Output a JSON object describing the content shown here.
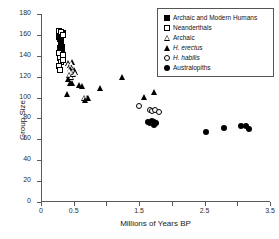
{
  "chart_data": {
    "type": "scatter",
    "title": "",
    "xlabel": "Millions of Years BP",
    "ylabel": "Group Size",
    "xlim": [
      0,
      3.5
    ],
    "ylim": [
      0,
      180
    ],
    "grid": false,
    "legend_position": "upper right",
    "xticks": [
      0,
      0.5,
      1.0,
      1.5,
      2.0,
      2.5,
      3.0,
      3.5
    ],
    "xtick_labels": [
      "0",
      "0.5",
      "",
      "1.5",
      "",
      "2.5",
      "",
      "3.5"
    ],
    "yticks": [
      0,
      20,
      40,
      60,
      80,
      100,
      120,
      140,
      160,
      180
    ],
    "ytick_labels": [
      "0",
      "20",
      "40",
      "60",
      "80",
      "100",
      "120",
      "140",
      "160",
      "180"
    ],
    "series": [
      {
        "name": "Archaic and Modern Humans",
        "marker": "filled-square",
        "points": [
          [
            0.28,
            158
          ],
          [
            0.29,
            156
          ],
          [
            0.3,
            154
          ],
          [
            0.31,
            152
          ],
          [
            0.3,
            150
          ],
          [
            0.32,
            148
          ],
          [
            0.31,
            160
          ],
          [
            0.33,
            162
          ],
          [
            0.29,
            147
          ],
          [
            0.32,
            144
          ]
        ]
      },
      {
        "name": "Neanderthals",
        "marker": "open-square",
        "points": [
          [
            0.27,
            164
          ],
          [
            0.31,
            163
          ],
          [
            0.33,
            160
          ],
          [
            0.28,
            143
          ],
          [
            0.29,
            138
          ],
          [
            0.3,
            134
          ],
          [
            0.28,
            130
          ],
          [
            0.29,
            126
          ],
          [
            0.33,
            141
          ],
          [
            0.34,
            136
          ]
        ]
      },
      {
        "name": "Archaic",
        "marker": "open-triangle",
        "points": [
          [
            0.42,
            133
          ],
          [
            0.45,
            131
          ],
          [
            0.47,
            134
          ],
          [
            0.44,
            127
          ],
          [
            0.47,
            125
          ],
          [
            0.5,
            126
          ],
          [
            0.43,
            122
          ],
          [
            0.46,
            120
          ],
          [
            0.49,
            123
          ],
          [
            0.52,
            124
          ],
          [
            0.66,
            100
          ],
          [
            0.7,
            100
          ]
        ]
      },
      {
        "name": "H. erectus",
        "marker": "filled-triangle",
        "points": [
          [
            0.41,
            118
          ],
          [
            0.44,
            114
          ],
          [
            0.48,
            114
          ],
          [
            0.4,
            103
          ],
          [
            0.58,
            112
          ],
          [
            0.62,
            111
          ],
          [
            0.67,
            98
          ],
          [
            0.72,
            100
          ],
          [
            0.9,
            109
          ],
          [
            1.24,
            120
          ],
          [
            1.58,
            101
          ],
          [
            1.73,
            105
          ]
        ]
      },
      {
        "name": "H. habilis",
        "marker": "open-circle",
        "points": [
          [
            1.5,
            92
          ],
          [
            1.66,
            88
          ],
          [
            1.7,
            87
          ],
          [
            1.74,
            88
          ],
          [
            1.8,
            86
          ]
        ]
      },
      {
        "name": "Australopiths",
        "marker": "filled-circle",
        "points": [
          [
            1.63,
            77
          ],
          [
            1.67,
            76
          ],
          [
            1.7,
            78
          ],
          [
            1.73,
            77
          ],
          [
            1.76,
            76
          ],
          [
            1.72,
            74
          ],
          [
            2.52,
            67
          ],
          [
            2.8,
            71
          ],
          [
            3.06,
            73
          ],
          [
            3.13,
            73
          ],
          [
            3.18,
            70
          ]
        ]
      }
    ]
  },
  "legend": {
    "items": [
      {
        "label": "Archaic and Modern Humans",
        "marker": "filled-square",
        "italic": false
      },
      {
        "label": "Neanderthals",
        "marker": "open-square",
        "italic": false
      },
      {
        "label": "Archaic",
        "marker": "open-triangle",
        "italic": false
      },
      {
        "label": "H. erectus",
        "marker": "filled-triangle",
        "italic": true
      },
      {
        "label": "H. habilis",
        "marker": "open-circle",
        "italic": true
      },
      {
        "label": "Australopiths",
        "marker": "filled-circle",
        "italic": false
      }
    ]
  }
}
